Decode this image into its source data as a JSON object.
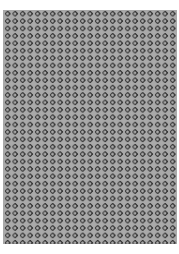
{
  "image": {
    "description": "Repeating grid of small dark ring circles on a gray background",
    "colors": {
      "background": "#a9a9a9",
      "ring": "#3a3a3a",
      "margin": "#ffffff"
    },
    "pattern": {
      "shape": "ring",
      "columns": 23,
      "rows": 32,
      "pitch_px": 7.5
    }
  }
}
